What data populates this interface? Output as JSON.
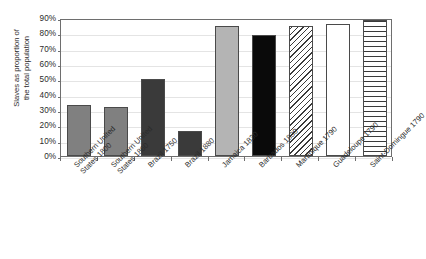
{
  "chart_data": {
    "type": "bar",
    "title": "",
    "subtitle": "",
    "xlabel": "",
    "ylabel": "Slaves as proportion of the total population",
    "ylabel_lines": [
      "Slaves as proportion of",
      "the total population"
    ],
    "ylim": [
      0,
      90
    ],
    "ytick_values": [
      90,
      80,
      70,
      60,
      50,
      40,
      30,
      20,
      10,
      0
    ],
    "ytick_labels": [
      "90%",
      "80%",
      "70%",
      "60%",
      "50%",
      "40%",
      "30%",
      "20%",
      "10%",
      "0%"
    ],
    "grid": true,
    "grid_axis": "y",
    "legend": false,
    "legend_position": "none",
    "categories": [
      "Southern United States 1800",
      "Southern United States 1860",
      "Brazil 1750",
      "Brazil 1880",
      "Jamaica 1830",
      "Barbados 1830",
      "Martinique 1790",
      "Guadeloupe 1790",
      "Saint-Domingue 1790"
    ],
    "values": [
      33,
      32,
      50,
      16,
      85,
      79,
      85,
      86,
      89
    ],
    "bars": [
      {
        "label": "Southern United States 1800",
        "label_lines": [
          "Southern United",
          "States 1800"
        ],
        "value": 33,
        "fill": "mediumgray",
        "fill_color": "#808080"
      },
      {
        "label": "Southern United States 1860",
        "label_lines": [
          "Southern United",
          "States 1860"
        ],
        "value": 32,
        "fill": "mediumgray",
        "fill_color": "#808080"
      },
      {
        "label": "Brazil 1750",
        "label_lines": [
          "Brazil 1750"
        ],
        "value": 50,
        "fill": "darkgray",
        "fill_color": "#3a3a3a"
      },
      {
        "label": "Brazil 1880",
        "label_lines": [
          "Brazil 1880"
        ],
        "value": 16,
        "fill": "darkgray",
        "fill_color": "#3a3a3a"
      },
      {
        "label": "Jamaica 1830",
        "label_lines": [
          "Jamaica 1830"
        ],
        "value": 85,
        "fill": "lightgray",
        "fill_color": "#b4b4b4"
      },
      {
        "label": "Barbados 1830",
        "label_lines": [
          "Barbados 1830"
        ],
        "value": 79,
        "fill": "black",
        "fill_color": "#0a0a0a"
      },
      {
        "label": "Martinique 1790",
        "label_lines": [
          "Martinique 1790"
        ],
        "value": 85,
        "fill": "diagonal",
        "fill_color": "#ffffff"
      },
      {
        "label": "Guadeloupe 1790",
        "label_lines": [
          "Guadeloupe 1790"
        ],
        "value": 86,
        "fill": "white",
        "fill_color": "#ffffff"
      },
      {
        "label": "Saint-Domingue 1790",
        "label_lines": [
          "Saint-Domingue 1790"
        ],
        "value": 89,
        "fill": "horizontal",
        "fill_color": "#ffffff"
      }
    ],
    "colors": {
      "axis": "#6e6e6e",
      "grid": "#e4e4e4",
      "text": "#2b2b2b",
      "bar_outline": "#4a4a4a",
      "background": "#ffffff"
    }
  }
}
